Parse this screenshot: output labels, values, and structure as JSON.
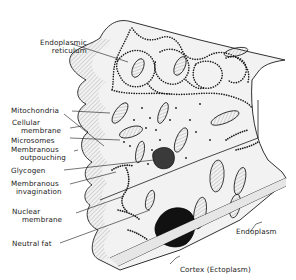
{
  "diagram": {
    "type": "cell-ultrastructure-illustration",
    "colors": {
      "ink": "#1a1a1a",
      "shade": "#bdbdbd",
      "paper": "#ffffff",
      "nucleus_fill": "#111111"
    },
    "labels": {
      "endoplasmic_reticulum": {
        "line1": "Endoplasmic",
        "line2": "reticulum"
      },
      "mitochondria": "Mitochondria",
      "cellular_membrane": {
        "line1": "Cellular",
        "line2": "membrane"
      },
      "microsomes": "Microsomes",
      "membranous_outpouching": {
        "line1": "Membranous",
        "line2": "outpouching"
      },
      "glycogen": "Glycogen",
      "membranous_invagination": {
        "line1": "Membranous",
        "line2": "invagination"
      },
      "nuclear_membrane": {
        "line1": "Nuclear",
        "line2": "membrane"
      },
      "neutral_fat": "Neutral fat",
      "endoplasm": "Endoplasm",
      "cortex": "Cortex (Ectoplasm)"
    }
  }
}
